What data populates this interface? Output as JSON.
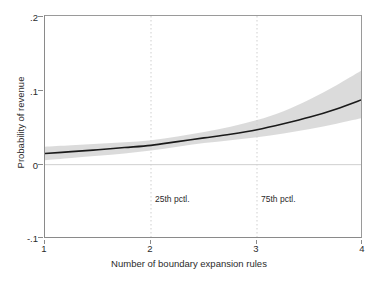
{
  "chart_data": {
    "type": "line",
    "title": "",
    "xlabel": "Number of boundary expansion rules",
    "ylabel": "Probability of revenue",
    "xlim": [
      1,
      4
    ],
    "ylim": [
      -0.1,
      0.2
    ],
    "xticks": [
      1,
      2,
      3,
      4
    ],
    "xticklabels": [
      "1",
      "2",
      "3",
      "4"
    ],
    "yticks": [
      -0.1,
      0,
      0.1,
      0.2
    ],
    "yticklabels": [
      "-.1",
      "0",
      ".1",
      ".2"
    ],
    "grid": "vertical dotted reference lines at x=2 and x=3; light horizontal reference line at y=0",
    "legend": "none",
    "series": [
      {
        "name": "Predicted probability of revenue",
        "type": "line",
        "color": "#1a1a1a",
        "x": [
          1.0,
          1.25,
          1.5,
          1.75,
          2.0,
          2.25,
          2.5,
          2.75,
          3.0,
          3.25,
          3.5,
          3.75,
          4.0
        ],
        "values": [
          0.015,
          0.0175,
          0.02,
          0.023,
          0.026,
          0.031,
          0.036,
          0.041,
          0.047,
          0.055,
          0.064,
          0.075,
          0.088
        ]
      },
      {
        "name": "95% confidence interval (upper)",
        "type": "band-upper",
        "color": "#d9d9d9",
        "x": [
          1.0,
          1.25,
          1.5,
          1.75,
          2.0,
          2.25,
          2.5,
          2.75,
          3.0,
          3.25,
          3.5,
          3.75,
          4.0
        ],
        "values": [
          0.024,
          0.026,
          0.028,
          0.03,
          0.033,
          0.038,
          0.044,
          0.051,
          0.06,
          0.072,
          0.088,
          0.107,
          0.128
        ]
      },
      {
        "name": "95% confidence interval (lower)",
        "type": "band-lower",
        "color": "#d9d9d9",
        "x": [
          1.0,
          1.25,
          1.5,
          1.75,
          2.0,
          2.25,
          2.5,
          2.75,
          3.0,
          3.25,
          3.5,
          3.75,
          4.0
        ],
        "values": [
          0.006,
          0.009,
          0.012,
          0.015,
          0.019,
          0.024,
          0.029,
          0.033,
          0.037,
          0.042,
          0.048,
          0.055,
          0.063
        ]
      }
    ],
    "annotations": [
      {
        "text": "25th pctl.",
        "x": 2,
        "y": -0.047
      },
      {
        "text": "75th pctl.",
        "x": 3,
        "y": -0.047
      }
    ]
  },
  "axes": {
    "y_title": "Probability of revenue",
    "x_title": "Number of boundary expansion rules",
    "y_tick_labels": [
      "-.1",
      "0",
      ".1",
      ".2"
    ],
    "x_tick_labels": [
      "1",
      "2",
      "3",
      "4"
    ]
  },
  "annotations": {
    "p25_label": "25th pctl.",
    "p75_label": "75th pctl."
  },
  "colors": {
    "line": "#1a1a1a",
    "band": "#d9d9d9",
    "axis": "#8a8a8a",
    "zero_line": "#cfcfcf",
    "gridline": "#d0d0d0",
    "text": "#2b2b2b",
    "background": "#ffffff"
  }
}
